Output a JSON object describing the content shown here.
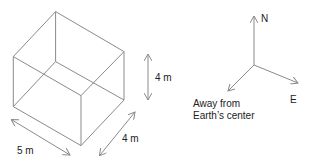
{
  "diagram": {
    "box": {
      "dimensions": {
        "height_label": "4 m",
        "length_label": "5 m",
        "width_label": "4 m"
      }
    },
    "compass": {
      "north_label": "N",
      "east_label": "E",
      "away_label_line1": "Away from",
      "away_label_line2": "Earth’s center"
    },
    "colors": {
      "line": "#8a8a8a",
      "text": "#222222",
      "background": "#ffffff"
    }
  }
}
